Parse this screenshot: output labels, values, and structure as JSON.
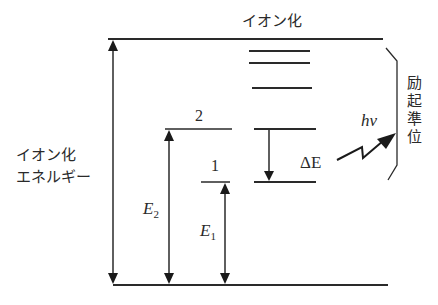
{
  "diagram": {
    "type": "energy-level-diagram",
    "labels": {
      "ionization_top": "イオン化",
      "ionization_energy_line1": "イオン化",
      "ionization_energy_line2": "エネルギー",
      "excited_levels_chars": [
        "励",
        "起",
        "準",
        "位"
      ],
      "level_2": "2",
      "level_1": "1",
      "e2_symbol": "E",
      "e2_subscript": "2",
      "e1_symbol": "E",
      "e1_subscript": "1",
      "delta_e": "ΔE",
      "photon_h": "h",
      "photon_nu": "ν"
    },
    "levels": [
      {
        "name": "ionization",
        "y": 39
      },
      {
        "name": "excited-a",
        "y": 51
      },
      {
        "name": "excited-b",
        "y": 63
      },
      {
        "name": "excited-c",
        "y": 88
      },
      {
        "name": "level-2",
        "y": 129
      },
      {
        "name": "level-1",
        "y": 182
      },
      {
        "name": "ground",
        "y": 285
      }
    ],
    "colors": {
      "line": "#2a2a2a",
      "background": "#ffffff"
    }
  }
}
